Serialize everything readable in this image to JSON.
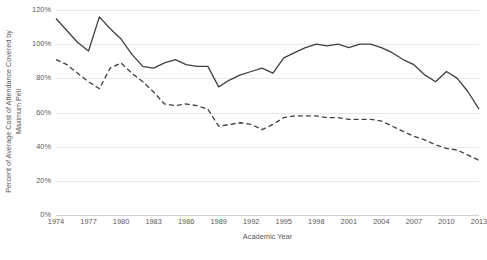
{
  "chart_data": {
    "type": "line",
    "title": "",
    "xlabel": "Academic Year",
    "ylabel": "Percent of Average Cost of Attendance Covered by Maximum Pell",
    "ylabel_line1": "Percent of Average Cost of Attendance Covered by",
    "ylabel_line2": "Maximum Pell",
    "ylim": [
      0,
      120
    ],
    "ytick_labels": [
      "0%",
      "20%",
      "40%",
      "60%",
      "80%",
      "100%",
      "120%"
    ],
    "ytick_values": [
      0,
      20,
      40,
      60,
      80,
      100,
      120
    ],
    "xtick_labels": [
      "1974",
      "1977",
      "1980",
      "1983",
      "1986",
      "1989",
      "1992",
      "1995",
      "1998",
      "2001",
      "2004",
      "2007",
      "2010",
      "2013"
    ],
    "xtick_values": [
      1974,
      1977,
      1980,
      1983,
      1986,
      1989,
      1992,
      1995,
      1998,
      2001,
      2004,
      2007,
      2010,
      2013
    ],
    "xlim": [
      1974,
      2013
    ],
    "grid": true,
    "legend": "none",
    "x": [
      1974,
      1975,
      1976,
      1977,
      1978,
      1979,
      1980,
      1981,
      1982,
      1983,
      1984,
      1985,
      1986,
      1987,
      1988,
      1989,
      1990,
      1991,
      1992,
      1993,
      1994,
      1995,
      1996,
      1997,
      1998,
      1999,
      2000,
      2001,
      2002,
      2003,
      2004,
      2005,
      2006,
      2007,
      2008,
      2009,
      2010,
      2011,
      2012,
      2013
    ],
    "series": [
      {
        "name": "Public Institutions",
        "style": "solid",
        "color": "#404040",
        "values": [
          115,
          108,
          101,
          96,
          116,
          109,
          103,
          94,
          87,
          86,
          89,
          91,
          88,
          87,
          87,
          75,
          79,
          82,
          84,
          86,
          83,
          92,
          95,
          98,
          100,
          99,
          100,
          98,
          100,
          100,
          98,
          95,
          91,
          88,
          82,
          78,
          84,
          80,
          72,
          62
        ]
      },
      {
        "name": "Private Institutions",
        "style": "dashed",
        "color": "#404040",
        "values": [
          91,
          88,
          83,
          78,
          74,
          86,
          89,
          83,
          78,
          72,
          65,
          64,
          65,
          64,
          62,
          52,
          53,
          54,
          53,
          50,
          53,
          57,
          58,
          58,
          58,
          57,
          57,
          56,
          56,
          56,
          55,
          52,
          49,
          46,
          44,
          41,
          39,
          38,
          35,
          32
        ]
      }
    ],
    "axis_color": "#d0d0d0",
    "gridline_color": "#e8e8e8",
    "background": "#ffffff"
  }
}
